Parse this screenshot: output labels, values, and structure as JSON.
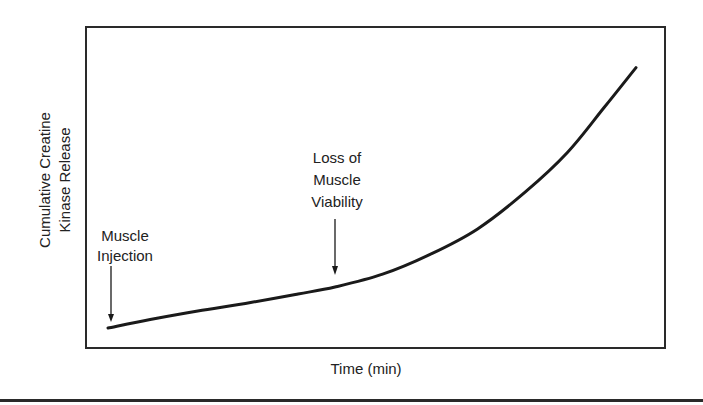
{
  "chart_data": {
    "type": "line",
    "title": "",
    "xlabel": "Time (min)",
    "ylabel": "Cumulative Creatine Kinase Release",
    "ylabel_lines": [
      "Cumulative Creatine",
      "Kinase Release"
    ],
    "grid": false,
    "legend": null,
    "axis_ticks": false,
    "x_range_px": [
      86,
      664
    ],
    "y_range_px": [
      28,
      347
    ],
    "series": [
      {
        "name": "Cumulative Creatine Kinase Release",
        "color": "#1a1a1a",
        "points_relative": [
          {
            "x": 0.0,
            "y": 0.0
          },
          {
            "x": 0.08,
            "y": 0.03
          },
          {
            "x": 0.17,
            "y": 0.06
          },
          {
            "x": 0.27,
            "y": 0.09
          },
          {
            "x": 0.36,
            "y": 0.12
          },
          {
            "x": 0.43,
            "y": 0.145
          },
          {
            "x": 0.52,
            "y": 0.19
          },
          {
            "x": 0.61,
            "y": 0.26
          },
          {
            "x": 0.7,
            "y": 0.35
          },
          {
            "x": 0.79,
            "y": 0.48
          },
          {
            "x": 0.87,
            "y": 0.62
          },
          {
            "x": 0.94,
            "y": 0.78
          },
          {
            "x": 1.0,
            "y": 0.92
          }
        ]
      }
    ],
    "annotations": [
      {
        "text": "Muscle Injection",
        "lines": [
          "Muscle",
          "Injection"
        ],
        "arrow_to": "curve start",
        "x_relative": 0.0
      },
      {
        "text": "Loss of Muscle Viability",
        "lines": [
          "Loss of",
          "Muscle",
          "Viability"
        ],
        "arrow_to": "inflection point",
        "x_relative": 0.43
      }
    ]
  },
  "labels": {
    "y_axis": {
      "line1": "Cumulative Creatine",
      "line2": "Kinase Release"
    },
    "x_axis": "Time (min)",
    "annotation_injection": {
      "line1": "Muscle",
      "line2": "Injection"
    },
    "annotation_viability": {
      "line1": "Loss of",
      "line2": "Muscle",
      "line3": "Viability"
    }
  },
  "colors": {
    "line": "#1a1a1a",
    "frame": "#2a2a2a",
    "background": "#ffffff"
  }
}
